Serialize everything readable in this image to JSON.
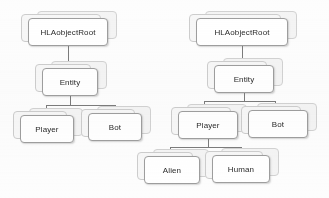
{
  "diagram": {
    "type": "class-hierarchy",
    "background_color": "#fdfdfd",
    "node_border_color": "#9e9e9e",
    "connector_color": "#7b7b7b",
    "text_color": "#2b2b2b",
    "trees": [
      {
        "name": "left-tree",
        "root": "HLAobjectRoot",
        "nodes": [
          {
            "id": "l-root",
            "label": "HLAobjectRoot",
            "x": 28,
            "y": 18,
            "w": 80,
            "h": 28,
            "parent": null
          },
          {
            "id": "l-entity",
            "label": "Entity",
            "x": 42,
            "y": 68,
            "w": 56,
            "h": 28,
            "parent": "l-root"
          },
          {
            "id": "l-player",
            "label": "Player",
            "x": 20,
            "y": 115,
            "w": 54,
            "h": 28,
            "parent": "l-entity"
          },
          {
            "id": "l-bot",
            "label": "Bot",
            "x": 88,
            "y": 113,
            "w": 54,
            "h": 28,
            "parent": "l-entity"
          }
        ]
      },
      {
        "name": "right-tree",
        "root": "HLAobjectRoot",
        "nodes": [
          {
            "id": "r-root",
            "label": "HLAobjectRoot",
            "x": 196,
            "y": 18,
            "w": 92,
            "h": 28,
            "parent": null
          },
          {
            "id": "r-entity",
            "label": "Entity",
            "x": 214,
            "y": 65,
            "w": 60,
            "h": 28,
            "parent": "r-root"
          },
          {
            "id": "r-player",
            "label": "Player",
            "x": 178,
            "y": 111,
            "w": 60,
            "h": 28,
            "parent": "r-entity"
          },
          {
            "id": "r-bot",
            "label": "Bot",
            "x": 248,
            "y": 110,
            "w": 60,
            "h": 28,
            "parent": "r-entity"
          },
          {
            "id": "r-alien",
            "label": "Alien",
            "x": 144,
            "y": 156,
            "w": 56,
            "h": 28,
            "parent": "r-player"
          },
          {
            "id": "r-human",
            "label": "Human",
            "x": 212,
            "y": 155,
            "w": 58,
            "h": 28,
            "parent": "r-player"
          }
        ]
      }
    ],
    "connectors": [
      {
        "name": "l-root-to-entity-v1",
        "orient": "v",
        "x": 68,
        "y": 46,
        "len": 11
      },
      {
        "name": "l-root-to-entity-v2",
        "orient": "v",
        "x": 68,
        "y": 57,
        "len": 11
      },
      {
        "name": "l-entity-stem",
        "orient": "v",
        "x": 70,
        "y": 96,
        "len": 9
      },
      {
        "name": "l-entity-bus",
        "orient": "h",
        "x": 46,
        "y": 105,
        "len": 69
      },
      {
        "name": "l-bus-to-player",
        "orient": "v",
        "x": 46,
        "y": 105,
        "len": 10
      },
      {
        "name": "l-bus-to-bot",
        "orient": "v",
        "x": 115,
        "y": 105,
        "len": 8
      },
      {
        "name": "r-root-to-entity",
        "orient": "v",
        "x": 242,
        "y": 46,
        "len": 19
      },
      {
        "name": "r-entity-stem",
        "orient": "v",
        "x": 244,
        "y": 93,
        "len": 8
      },
      {
        "name": "r-entity-bus",
        "orient": "h",
        "x": 204,
        "y": 101,
        "len": 71
      },
      {
        "name": "r-bus-to-player",
        "orient": "v",
        "x": 204,
        "y": 101,
        "len": 10
      },
      {
        "name": "r-bus-to-bot",
        "orient": "v",
        "x": 275,
        "y": 101,
        "len": 9
      },
      {
        "name": "r-player-stem",
        "orient": "v",
        "x": 208,
        "y": 139,
        "len": 8
      },
      {
        "name": "r-player-bus",
        "orient": "h",
        "x": 170,
        "y": 147,
        "len": 71
      },
      {
        "name": "r-bus-to-alien",
        "orient": "v",
        "x": 170,
        "y": 147,
        "len": 9
      },
      {
        "name": "r-bus-to-human",
        "orient": "v",
        "x": 241,
        "y": 147,
        "len": 8
      }
    ]
  }
}
